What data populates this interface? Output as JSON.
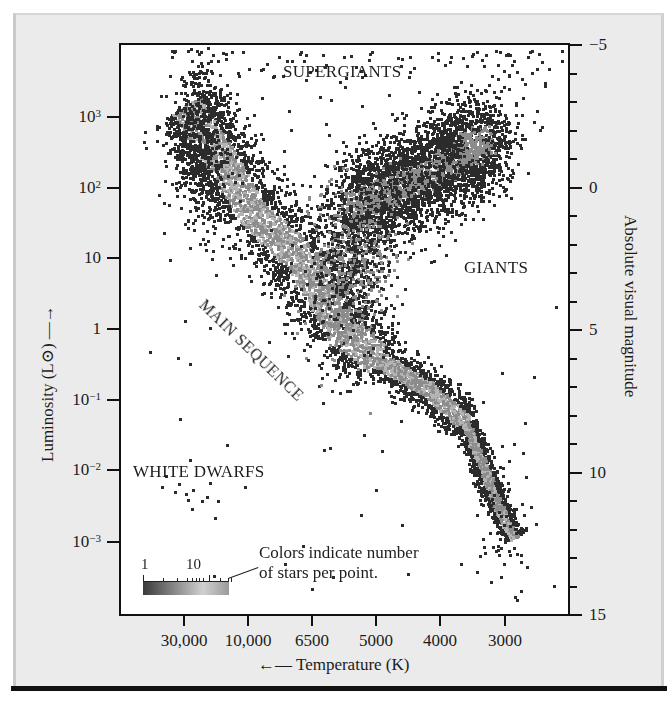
{
  "chart_data": {
    "type": "scatter",
    "xlabel": "← Temperature (K)",
    "ylabel_left": "Luminosity (L⊙) →",
    "ylabel_right": "Absolute visual magnitude",
    "x_scale": "log, reversed (hot on left)",
    "y_scale_left": "log",
    "x_ticks": [
      "30,000",
      "10,000",
      "6500",
      "5000",
      "4000",
      "3000"
    ],
    "y_ticks_left": [
      {
        "base": "10",
        "exp": "3",
        "value": 1000
      },
      {
        "base": "10",
        "exp": "2",
        "value": 100
      },
      {
        "base": "10",
        "exp": "",
        "value": 10
      },
      {
        "base": "1",
        "exp": "",
        "value": 1
      },
      {
        "base": "10",
        "exp": "−1",
        "value": 0.1
      },
      {
        "base": "10",
        "exp": "−2",
        "value": 0.01
      },
      {
        "base": "10",
        "exp": "−3",
        "value": 0.001
      }
    ],
    "y_ticks_right": [
      "−5",
      "0",
      "5",
      "10",
      "15"
    ],
    "y_range_right": [
      -5,
      15
    ],
    "y_range_left_log10": [
      -4,
      4
    ],
    "grid": false,
    "annotations": [
      "SUPERGIANTS",
      "GIANTS",
      "MAIN SEQUENCE",
      "WHITE DWARFS"
    ],
    "legend": {
      "colorbar_labels": [
        "1",
        "10"
      ],
      "text_line1": "Colors indicate number",
      "text_line2": "of stars per point.",
      "colorscale": [
        "#3a3a3a",
        "#9a9a9a",
        "#d0d0d0"
      ]
    },
    "regions": [
      {
        "name": "main sequence",
        "points_T_L": [
          [
            30000,
            1500
          ],
          [
            15000,
            200
          ],
          [
            10000,
            50
          ],
          [
            7000,
            10
          ],
          [
            5800,
            1
          ],
          [
            5000,
            0.4
          ],
          [
            4200,
            0.15
          ],
          [
            3600,
            0.05
          ],
          [
            3300,
            0.01
          ],
          [
            3100,
            0.003
          ],
          [
            2900,
            0.0012
          ]
        ]
      },
      {
        "name": "giant branch",
        "points_T_L": [
          [
            5500,
            50
          ],
          [
            5000,
            80
          ],
          [
            4500,
            120
          ],
          [
            4000,
            200
          ],
          [
            3600,
            350
          ],
          [
            3300,
            500
          ]
        ]
      },
      {
        "name": "supergiants",
        "L_range": [
          1000,
          100000
        ],
        "T_range": [
          3000,
          30000
        ],
        "density": "sparse"
      },
      {
        "name": "white dwarfs",
        "T_range": [
          9000,
          25000
        ],
        "L_range": [
          0.001,
          0.01
        ],
        "density": "sparse"
      }
    ]
  },
  "labels": {
    "supergiants": "SUPERGIANTS",
    "giants": "GIANTS",
    "main_sequence": "MAIN SEQUENCE",
    "white_dwarfs": "WHITE DWARFS",
    "cbar_1": "1",
    "cbar_10": "10",
    "note1": "Colors indicate number",
    "note2": "of stars per point.",
    "xtitle": "←— Temperature (K)",
    "ytitle_left": "Luminosity (L⊙) —→",
    "ytitle_right": "Absolute visual magnitude"
  },
  "colors": {
    "frame": "#111111",
    "panel_bg": "#ebebeb",
    "plot_bg": "#ffffff",
    "dot_dark": "#2b2b2b",
    "dot_mid": "#8c8c8c",
    "dot_light": "#b4b4b4"
  }
}
